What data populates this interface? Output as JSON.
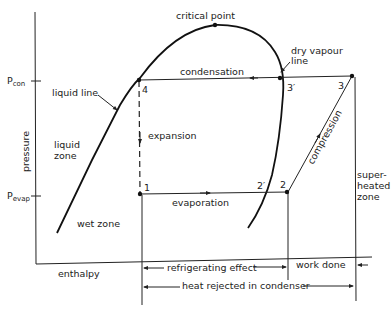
{
  "diagram": {
    "axes": {
      "y_label": "pressure",
      "x_label": "enthalpy",
      "p_con_main": "P",
      "p_con_sub": "con",
      "p_evap_main": "P",
      "p_evap_sub": "evap"
    },
    "points": {
      "p1": "1",
      "p2": "2",
      "p2_prime": "2′",
      "p3": "3",
      "p3_prime": "3′",
      "p4": "4"
    },
    "labels": {
      "critical_point": "critical point",
      "dry_vapour_line_1": "dry vapour",
      "dry_vapour_line_2": "line",
      "liquid_line": "liquid line",
      "liquid_zone_1": "liquid",
      "liquid_zone_2": "zone",
      "wet_zone": "wet zone",
      "superheated_1": "super-",
      "superheated_2": "heated",
      "superheated_3": "zone",
      "condensation": "condensation",
      "expansion": "expansion",
      "evaporation": "evaporation",
      "compression": "compression"
    },
    "dimensions": {
      "refrigerating_effect": "refrigerating effect",
      "work_done": "work done",
      "heat_rejected": "heat rejected in condenser"
    },
    "colors": {
      "ink": "#222222",
      "background": "#ffffff"
    }
  }
}
